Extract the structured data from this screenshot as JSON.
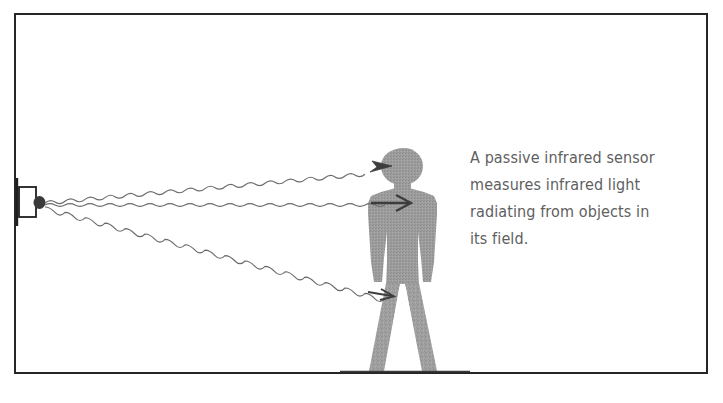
{
  "figure": {
    "frame": {
      "border_color": "#262626",
      "background": "#ffffff"
    },
    "caption": {
      "lines": [
        "A passive infrared sensor",
        "measures infrared light",
        "radiating from objects in",
        "its field."
      ],
      "full_text": "A passive infrared sensor measures infrared light radiating from objects in its field.",
      "text_color": "#5f5f5f"
    },
    "sensor": {
      "label": "passive-infrared-sensor",
      "body_fill": "#ffffff",
      "body_stroke": "#1f1f1f",
      "lens_fill": "#3a3a3a"
    },
    "person": {
      "label": "human-figure-silhouette",
      "fill": "#9b9b9b",
      "texture": "halftone-dither"
    },
    "rays": {
      "label": "infrared-radiation-waves",
      "count": 3,
      "stroke": "#6b6b6b",
      "targets": [
        "head",
        "chest",
        "leg"
      ],
      "wavelength_px": 20,
      "amplitude_px": 2.6
    },
    "arrows": {
      "label": "direction-arrowheads",
      "stroke": "#3d3d3d",
      "count": 3
    },
    "ground": {
      "label": "ground-line",
      "stroke": "#262626"
    }
  }
}
